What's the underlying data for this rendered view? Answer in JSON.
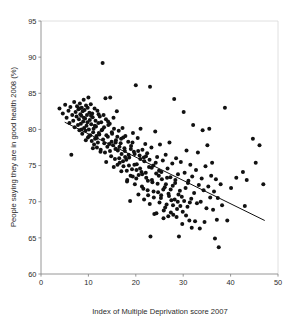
{
  "chart_data": {
    "type": "scatter",
    "title": "",
    "xlabel": "Index of Multiple Deprivation score 2007",
    "ylabel": "People saying they are in good health 2008 (%)",
    "xlim": [
      0,
      50
    ],
    "ylim": [
      60,
      95
    ],
    "xticks": [
      0,
      10,
      20,
      30,
      40,
      50
    ],
    "yticks": [
      60,
      65,
      70,
      75,
      80,
      85,
      90,
      95
    ],
    "xtick_labels": [
      "0",
      "10",
      "20",
      "30",
      "40",
      "50"
    ],
    "ytick_labels": [
      "60",
      "65",
      "70",
      "75",
      "80",
      "85",
      "90",
      "95"
    ],
    "grid": false,
    "legend": "none",
    "marker": {
      "shape": "circle",
      "color": "#111111",
      "size_px": 4
    },
    "trendline": {
      "type": "linear",
      "color": "#111111",
      "x_start": 5.0,
      "y_start": 81.0,
      "x_end": 47.2,
      "y_end": 67.4
    },
    "point_count": 300,
    "points": [
      [
        3.9,
        82.9
      ],
      [
        4.6,
        82.2
      ],
      [
        5.1,
        83.4
      ],
      [
        5.4,
        81.6
      ],
      [
        5.8,
        82.6
      ],
      [
        6.0,
        80.9
      ],
      [
        6.2,
        83.1
      ],
      [
        6.4,
        76.5
      ],
      [
        6.6,
        82.0
      ],
      [
        6.8,
        81.2
      ],
      [
        7.0,
        83.8
      ],
      [
        7.1,
        80.3
      ],
      [
        7.3,
        82.4
      ],
      [
        7.5,
        81.8
      ],
      [
        7.6,
        83.2
      ],
      [
        7.8,
        80.6
      ],
      [
        7.9,
        82.8
      ],
      [
        8.0,
        81.4
      ],
      [
        8.1,
        79.9
      ],
      [
        8.2,
        83.6
      ],
      [
        8.3,
        82.1
      ],
      [
        8.4,
        80.8
      ],
      [
        8.5,
        81.9
      ],
      [
        8.6,
        83.0
      ],
      [
        8.7,
        79.4
      ],
      [
        8.8,
        82.5
      ],
      [
        8.9,
        81.1
      ],
      [
        9.0,
        84.1
      ],
      [
        9.1,
        80.2
      ],
      [
        9.2,
        82.7
      ],
      [
        9.3,
        81.5
      ],
      [
        9.4,
        79.8
      ],
      [
        9.5,
        83.3
      ],
      [
        9.6,
        80.5
      ],
      [
        9.7,
        82.0
      ],
      [
        9.8,
        81.0
      ],
      [
        9.9,
        78.9
      ],
      [
        10.0,
        84.4
      ],
      [
        10.1,
        80.0
      ],
      [
        10.2,
        82.3
      ],
      [
        10.3,
        81.3
      ],
      [
        10.4,
        79.2
      ],
      [
        10.5,
        83.5
      ],
      [
        10.6,
        80.7
      ],
      [
        10.7,
        78.4
      ],
      [
        10.8,
        82.2
      ],
      [
        10.9,
        81.7
      ],
      [
        11.0,
        79.6
      ],
      [
        11.1,
        80.1
      ],
      [
        11.2,
        77.9
      ],
      [
        11.3,
        82.9
      ],
      [
        11.4,
        78.7
      ],
      [
        11.5,
        81.2
      ],
      [
        11.6,
        80.4
      ],
      [
        11.7,
        79.1
      ],
      [
        11.8,
        77.5
      ],
      [
        11.9,
        82.6
      ],
      [
        12.0,
        78.2
      ],
      [
        12.1,
        80.9
      ],
      [
        12.2,
        79.5
      ],
      [
        12.4,
        81.8
      ],
      [
        12.6,
        77.2
      ],
      [
        12.8,
        79.9
      ],
      [
        13.0,
        89.2
      ],
      [
        13.1,
        78.6
      ],
      [
        13.3,
        80.3
      ],
      [
        13.5,
        76.8
      ],
      [
        13.6,
        84.3
      ],
      [
        13.8,
        79.2
      ],
      [
        14.0,
        77.6
      ],
      [
        14.2,
        80.6
      ],
      [
        14.4,
        78.0
      ],
      [
        14.6,
        84.4
      ],
      [
        14.8,
        76.3
      ],
      [
        15.0,
        79.4
      ],
      [
        15.2,
        77.8
      ],
      [
        15.4,
        80.1
      ],
      [
        15.6,
        75.9
      ],
      [
        15.8,
        78.5
      ],
      [
        16.0,
        82.5
      ],
      [
        16.2,
        77.1
      ],
      [
        16.4,
        79.8
      ],
      [
        16.6,
        75.4
      ],
      [
        16.8,
        78.1
      ],
      [
        17.0,
        76.6
      ],
      [
        17.2,
        80.2
      ],
      [
        17.4,
        74.9
      ],
      [
        17.6,
        77.4
      ],
      [
        17.8,
        79.1
      ],
      [
        18.0,
        75.8
      ],
      [
        18.2,
        73.0
      ],
      [
        18.4,
        78.3
      ],
      [
        18.6,
        76.1
      ],
      [
        18.8,
        70.1
      ],
      [
        19.0,
        77.7
      ],
      [
        19.2,
        74.5
      ],
      [
        19.4,
        79.5
      ],
      [
        19.6,
        76.9
      ],
      [
        19.8,
        72.4
      ],
      [
        20.0,
        86.1
      ],
      [
        20.2,
        75.2
      ],
      [
        20.4,
        78.8
      ],
      [
        20.6,
        73.7
      ],
      [
        20.8,
        76.4
      ],
      [
        21.0,
        80.1
      ],
      [
        21.2,
        74.1
      ],
      [
        21.4,
        77.2
      ],
      [
        21.6,
        71.8
      ],
      [
        21.8,
        75.6
      ],
      [
        22.0,
        78.0
      ],
      [
        22.2,
        73.3
      ],
      [
        22.4,
        76.7
      ],
      [
        22.6,
        70.9
      ],
      [
        22.8,
        74.8
      ],
      [
        23.0,
        85.9
      ],
      [
        23.1,
        65.2
      ],
      [
        23.3,
        77.5
      ],
      [
        23.5,
        72.7
      ],
      [
        23.7,
        75.0
      ],
      [
        23.9,
        68.3
      ],
      [
        24.1,
        79.7
      ],
      [
        24.3,
        73.9
      ],
      [
        24.5,
        76.2
      ],
      [
        24.7,
        71.3
      ],
      [
        24.9,
        74.3
      ],
      [
        25.1,
        77.9
      ],
      [
        25.3,
        70.5
      ],
      [
        25.5,
        73.1
      ],
      [
        25.7,
        75.7
      ],
      [
        25.9,
        68.8
      ],
      [
        26.1,
        72.0
      ],
      [
        26.3,
        76.5
      ],
      [
        26.5,
        69.6
      ],
      [
        26.7,
        74.6
      ],
      [
        26.9,
        71.1
      ],
      [
        27.1,
        78.2
      ],
      [
        27.3,
        73.4
      ],
      [
        27.5,
        70.2
      ],
      [
        27.7,
        75.3
      ],
      [
        27.9,
        68.2
      ],
      [
        28.1,
        84.2
      ],
      [
        28.3,
        72.6
      ],
      [
        28.5,
        76.0
      ],
      [
        28.7,
        69.0
      ],
      [
        28.9,
        73.8
      ],
      [
        29.1,
        65.2
      ],
      [
        29.3,
        71.5
      ],
      [
        29.5,
        75.5
      ],
      [
        29.7,
        70.7
      ],
      [
        29.9,
        68.6
      ],
      [
        30.1,
        82.4
      ],
      [
        30.3,
        74.0
      ],
      [
        30.5,
        71.9
      ],
      [
        30.7,
        77.1
      ],
      [
        30.9,
        69.3
      ],
      [
        31.1,
        72.9
      ],
      [
        31.3,
        67.4
      ],
      [
        31.5,
        75.1
      ],
      [
        31.7,
        70.4
      ],
      [
        31.9,
        73.5
      ],
      [
        32.1,
        80.6
      ],
      [
        32.3,
        71.2
      ],
      [
        32.5,
        67.3
      ],
      [
        32.7,
        74.4
      ],
      [
        32.9,
        69.8
      ],
      [
        33.1,
        76.8
      ],
      [
        33.3,
        72.3
      ],
      [
        33.5,
        66.3
      ],
      [
        33.7,
        70.0
      ],
      [
        33.9,
        73.2
      ],
      [
        34.1,
        79.9
      ],
      [
        34.3,
        71.6
      ],
      [
        34.5,
        67.2
      ],
      [
        34.7,
        74.9
      ],
      [
        34.9,
        69.1
      ],
      [
        35.1,
        77.8
      ],
      [
        35.3,
        72.1
      ],
      [
        35.5,
        80.1
      ],
      [
        35.7,
        70.6
      ],
      [
        35.9,
        73.6
      ],
      [
        36.1,
        75.4
      ],
      [
        36.3,
        68.9
      ],
      [
        36.5,
        71.4
      ],
      [
        36.7,
        64.9
      ],
      [
        36.9,
        73.1
      ],
      [
        37.1,
        67.5
      ],
      [
        37.3,
        70.5
      ],
      [
        37.5,
        63.7
      ],
      [
        37.9,
        72.4
      ],
      [
        38.2,
        69.5
      ],
      [
        38.8,
        83.0
      ],
      [
        39.3,
        67.4
      ],
      [
        40.1,
        71.9
      ],
      [
        41.2,
        73.3
      ],
      [
        42.6,
        74.1
      ],
      [
        43.0,
        69.4
      ],
      [
        43.4,
        73.0
      ],
      [
        44.7,
        78.7
      ],
      [
        45.3,
        75.4
      ],
      [
        46.1,
        77.8
      ],
      [
        46.9,
        72.4
      ],
      [
        12.3,
        79.3
      ],
      [
        12.7,
        81.0
      ],
      [
        13.2,
        82.0
      ],
      [
        13.7,
        81.4
      ],
      [
        14.1,
        79.0
      ],
      [
        14.5,
        80.8
      ],
      [
        14.9,
        78.3
      ],
      [
        15.3,
        81.6
      ],
      [
        15.7,
        77.3
      ],
      [
        16.1,
        79.0
      ],
      [
        16.5,
        76.0
      ],
      [
        16.9,
        78.7
      ],
      [
        17.3,
        75.6
      ],
      [
        17.7,
        77.0
      ],
      [
        18.1,
        74.3
      ],
      [
        18.5,
        76.5
      ],
      [
        18.9,
        73.6
      ],
      [
        19.3,
        78.2
      ],
      [
        19.7,
        75.1
      ],
      [
        20.1,
        73.2
      ],
      [
        20.5,
        77.0
      ],
      [
        20.9,
        74.6
      ],
      [
        21.3,
        72.1
      ],
      [
        21.7,
        76.1
      ],
      [
        22.1,
        74.0
      ],
      [
        22.5,
        71.6
      ],
      [
        22.9,
        75.8
      ],
      [
        23.4,
        73.0
      ],
      [
        23.8,
        70.6
      ],
      [
        24.2,
        75.4
      ],
      [
        24.6,
        72.5
      ],
      [
        25.0,
        69.9
      ],
      [
        25.4,
        74.1
      ],
      [
        25.8,
        71.7
      ],
      [
        26.2,
        69.2
      ],
      [
        26.6,
        73.3
      ],
      [
        27.0,
        70.8
      ],
      [
        27.4,
        68.5
      ],
      [
        27.8,
        72.2
      ],
      [
        28.2,
        70.3
      ],
      [
        28.6,
        67.9
      ],
      [
        29.0,
        71.0
      ],
      [
        29.4,
        69.4
      ],
      [
        29.8,
        66.9
      ],
      [
        30.2,
        70.1
      ],
      [
        30.6,
        68.1
      ],
      [
        31.0,
        72.6
      ],
      [
        31.4,
        69.9
      ],
      [
        31.8,
        66.4
      ],
      [
        8.15,
        82.9
      ],
      [
        8.55,
        80.0
      ],
      [
        9.05,
        81.6
      ],
      [
        9.45,
        78.5
      ],
      [
        9.85,
        83.0
      ],
      [
        10.15,
        79.1
      ],
      [
        10.55,
        81.9
      ],
      [
        10.95,
        77.4
      ],
      [
        11.35,
        80.5
      ],
      [
        11.75,
        78.8
      ],
      [
        12.15,
        82.1
      ],
      [
        12.55,
        76.9
      ],
      [
        12.95,
        80.0
      ],
      [
        13.35,
        78.1
      ],
      [
        13.75,
        75.5
      ],
      [
        14.15,
        81.1
      ],
      [
        14.55,
        77.0
      ],
      [
        14.95,
        79.6
      ],
      [
        15.35,
        74.8
      ],
      [
        15.75,
        78.2
      ],
      [
        16.15,
        75.1
      ],
      [
        16.55,
        77.6
      ],
      [
        16.95,
        74.2
      ],
      [
        17.35,
        78.9
      ],
      [
        17.75,
        76.2
      ],
      [
        18.15,
        72.8
      ],
      [
        18.55,
        75.0
      ],
      [
        18.95,
        77.3
      ],
      [
        19.35,
        73.5
      ],
      [
        19.75,
        76.6
      ],
      [
        20.15,
        74.4
      ],
      [
        20.55,
        71.0
      ],
      [
        20.95,
        75.9
      ],
      [
        21.35,
        73.8
      ],
      [
        21.75,
        70.3
      ],
      [
        22.15,
        76.3
      ],
      [
        22.55,
        72.9
      ],
      [
        22.95,
        69.7
      ],
      [
        23.35,
        74.7
      ],
      [
        23.75,
        71.4
      ],
      [
        24.35,
        68.4
      ],
      [
        24.85,
        73.6
      ],
      [
        25.35,
        70.9
      ],
      [
        25.85,
        67.7
      ],
      [
        26.35,
        72.4
      ],
      [
        26.85,
        68.0
      ],
      [
        27.35,
        71.7
      ],
      [
        27.85,
        69.5
      ],
      [
        28.35,
        73.0
      ],
      [
        28.85,
        70.0
      ]
    ]
  },
  "axis": {
    "x_title": "Index of Multiple Deprivation score 2007",
    "y_title": "People saying they are in good health 2008 (%)"
  }
}
